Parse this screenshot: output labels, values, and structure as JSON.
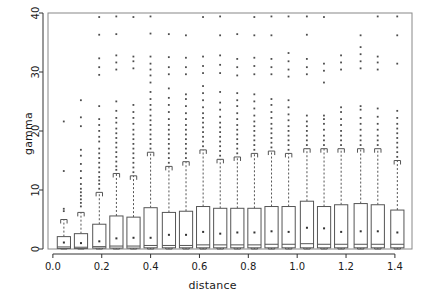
{
  "chart_data": {
    "type": "box",
    "title": "",
    "xlabel": "distance",
    "ylabel": "gamma",
    "xlim": [
      -0.02,
      1.47
    ],
    "ylim": [
      0,
      40
    ],
    "xticks": [
      0.0,
      0.2,
      0.4,
      0.6,
      0.8,
      1.0,
      1.2,
      1.4
    ],
    "xticklabels": [
      "0.0",
      "0.2",
      "0.4",
      "0.6",
      "0.8",
      "1.0",
      "1.2",
      "1.4"
    ],
    "yticks": [
      0,
      10,
      20,
      30,
      40
    ],
    "yticklabels": [
      "0",
      "10",
      "20",
      "30",
      "40"
    ],
    "grid": false,
    "legend": null,
    "box_line_color": "#555555",
    "whisker_style": "dashed",
    "mean_marker": "dot",
    "outlier_marker": "dot",
    "n_boxes": 19,
    "boxes": [
      {
        "x": 0.045,
        "q1": 0.1,
        "median": 0.35,
        "q3": 2.1,
        "whisker_low": 0.0,
        "whisker_high": 5.0,
        "mean": 1.1,
        "outliers": [
          6.4,
          6.8,
          13.2,
          21.6
        ]
      },
      {
        "x": 0.115,
        "q1": 0.1,
        "median": 0.3,
        "q3": 2.6,
        "whisker_low": 0.0,
        "whisker_high": 6.2,
        "mean": 1.0,
        "outliers": [
          7.2,
          7.8,
          8.4,
          9.0,
          9.6,
          10.2,
          11.0,
          12.0,
          13.2,
          14.4,
          15.8,
          16.8,
          20.8,
          22.3,
          25.2
        ]
      },
      {
        "x": 0.19,
        "q1": 0.15,
        "median": 0.4,
        "q3": 4.2,
        "whisker_low": 0.0,
        "whisker_high": 9.6,
        "mean": 1.3,
        "outliers": [
          10.2,
          11.0,
          11.6,
          12.2,
          13.0,
          13.8,
          14.6,
          15.4,
          16.2,
          17.0,
          18.2,
          19.0,
          20.0,
          21.0,
          22.0,
          24.2,
          29.5,
          30.8,
          32.3,
          36.3,
          39.3
        ]
      },
      {
        "x": 0.26,
        "q1": 0.15,
        "median": 0.5,
        "q3": 5.6,
        "whisker_low": 0.0,
        "whisker_high": 12.8,
        "mean": 1.8,
        "outliers": [
          13.4,
          14.0,
          14.8,
          15.6,
          16.4,
          17.2,
          18.0,
          18.8,
          19.6,
          20.4,
          21.4,
          22.2,
          23.4,
          25.0,
          30.4,
          31.6,
          32.8,
          36.4,
          39.4
        ]
      },
      {
        "x": 0.33,
        "q1": 0.15,
        "median": 0.5,
        "q3": 5.4,
        "whisker_low": 0.0,
        "whisker_high": 12.4,
        "mean": 1.9,
        "outliers": [
          13.0,
          13.8,
          14.6,
          15.4,
          16.2,
          17.0,
          17.8,
          18.6,
          19.4,
          20.2,
          21.2,
          22.2,
          23.2,
          24.4,
          30.6,
          31.8,
          32.6,
          39.3
        ]
      },
      {
        "x": 0.4,
        "q1": 0.2,
        "median": 0.6,
        "q3": 7.0,
        "whisker_low": 0.0,
        "whisker_high": 16.4,
        "mean": 1.9,
        "outliers": [
          17.0,
          17.8,
          18.6,
          19.4,
          20.2,
          21.0,
          21.8,
          22.6,
          23.6,
          24.4,
          25.4,
          26.6,
          28.2,
          29.4,
          30.4,
          31.4,
          32.6,
          36.5,
          39.4
        ]
      },
      {
        "x": 0.475,
        "q1": 0.2,
        "median": 0.6,
        "q3": 6.2,
        "whisker_low": 0.0,
        "whisker_high": 14.0,
        "mean": 2.4,
        "outliers": [
          14.6,
          15.4,
          16.2,
          17.0,
          17.8,
          18.6,
          19.4,
          20.2,
          21.0,
          22.0,
          23.2,
          24.4,
          25.6,
          27.2,
          29.6,
          30.8,
          32.5,
          36.4
        ]
      },
      {
        "x": 0.545,
        "q1": 0.2,
        "median": 0.6,
        "q3": 6.4,
        "whisker_low": 0.0,
        "whisker_high": 14.8,
        "mean": 2.4,
        "outliers": [
          15.4,
          16.2,
          17.0,
          17.8,
          18.6,
          19.4,
          20.2,
          21.0,
          22.0,
          23.0,
          24.2,
          25.4,
          26.2,
          29.6,
          30.8,
          32.4,
          36.2
        ]
      },
      {
        "x": 0.615,
        "q1": 0.2,
        "median": 0.7,
        "q3": 7.2,
        "whisker_low": 0.0,
        "whisker_high": 16.8,
        "mean": 2.9,
        "outliers": [
          17.4,
          18.2,
          19.0,
          19.8,
          20.6,
          21.4,
          22.2,
          23.0,
          24.0,
          25.2,
          26.4,
          27.6,
          29.8,
          31.0,
          32.6,
          39.3
        ]
      },
      {
        "x": 0.685,
        "q1": 0.2,
        "median": 0.7,
        "q3": 6.9,
        "whisker_low": 0.0,
        "whisker_high": 15.2,
        "mean": 2.6,
        "outliers": [
          15.8,
          16.6,
          17.4,
          18.2,
          19.0,
          19.8,
          20.6,
          21.4,
          22.4,
          23.6,
          24.8,
          26.6,
          29.8,
          31.2,
          32.8,
          36.2,
          39.4
        ]
      },
      {
        "x": 0.755,
        "q1": 0.2,
        "median": 0.7,
        "q3": 6.9,
        "whisker_low": 0.0,
        "whisker_high": 15.6,
        "mean": 2.8,
        "outliers": [
          16.2,
          17.0,
          17.8,
          18.6,
          19.4,
          20.2,
          21.0,
          22.0,
          23.0,
          24.2,
          25.2,
          26.4,
          29.4,
          30.8,
          32.2,
          36.4
        ]
      },
      {
        "x": 0.825,
        "q1": 0.2,
        "median": 0.7,
        "q3": 6.9,
        "whisker_low": 0.0,
        "whisker_high": 16.2,
        "mean": 2.8,
        "outliers": [
          16.8,
          17.6,
          18.4,
          19.2,
          20.0,
          20.8,
          21.6,
          22.6,
          23.8,
          25.0,
          26.2,
          29.6,
          31.0,
          32.4,
          36.2,
          39.3
        ]
      },
      {
        "x": 0.895,
        "q1": 0.2,
        "median": 0.8,
        "q3": 7.2,
        "whisker_low": 0.0,
        "whisker_high": 16.6,
        "mean": 3.0,
        "outliers": [
          17.2,
          18.0,
          18.8,
          19.6,
          20.4,
          21.2,
          22.2,
          23.2,
          24.4,
          25.4,
          29.6,
          30.8,
          32.2,
          36.2,
          39.4
        ]
      },
      {
        "x": 0.965,
        "q1": 0.2,
        "median": 0.8,
        "q3": 7.2,
        "whisker_low": 0.0,
        "whisker_high": 16.2,
        "mean": 2.9,
        "outliers": [
          16.8,
          17.6,
          18.4,
          19.2,
          20.0,
          20.8,
          21.8,
          22.8,
          24.0,
          25.2,
          29.2,
          30.4,
          31.8,
          33.2,
          39.4
        ]
      },
      {
        "x": 1.04,
        "q1": 0.2,
        "median": 0.9,
        "q3": 8.1,
        "whisker_low": 0.0,
        "whisker_high": 17.0,
        "mean": 3.6,
        "outliers": [
          17.6,
          18.4,
          19.2,
          20.0,
          20.8,
          21.6,
          22.6,
          29.6,
          30.8,
          32.2,
          36.3,
          39.4
        ]
      },
      {
        "x": 1.11,
        "q1": 0.2,
        "median": 0.8,
        "q3": 7.2,
        "whisker_low": 0.0,
        "whisker_high": 17.0,
        "mean": 3.5,
        "outliers": [
          17.6,
          18.4,
          19.2,
          20.2,
          21.2,
          22.0,
          22.6,
          28.2,
          30.2,
          31.4,
          39.3
        ]
      },
      {
        "x": 1.18,
        "q1": 0.2,
        "median": 0.8,
        "q3": 7.5,
        "whisker_low": 0.0,
        "whisker_high": 17.0,
        "mean": 2.9,
        "outliers": [
          17.6,
          18.4,
          19.2,
          20.0,
          21.0,
          22.0,
          23.2,
          24.0,
          30.4,
          31.6,
          32.8
        ]
      },
      {
        "x": 1.26,
        "q1": 0.2,
        "median": 0.8,
        "q3": 7.7,
        "whisker_low": 0.0,
        "whisker_high": 17.0,
        "mean": 3.0,
        "outliers": [
          17.6,
          18.4,
          19.2,
          20.2,
          21.2,
          22.2,
          23.6,
          24.2,
          30.6,
          31.8,
          33.0,
          34.2,
          36.2
        ]
      },
      {
        "x": 1.33,
        "q1": 0.2,
        "median": 0.8,
        "q3": 7.5,
        "whisker_low": 0.0,
        "whisker_high": 17.0,
        "mean": 3.0,
        "outliers": [
          17.6,
          18.4,
          19.2,
          20.2,
          21.2,
          22.4,
          23.8,
          30.4,
          31.6,
          32.6,
          39.4
        ]
      },
      {
        "x": 1.41,
        "q1": 0.2,
        "median": 0.8,
        "q3": 6.6,
        "whisker_low": 0.0,
        "whisker_high": 15.0,
        "mean": 2.8,
        "outliers": [
          15.6,
          16.4,
          17.2,
          18.0,
          18.8,
          19.6,
          20.4,
          21.2,
          22.2,
          23.4,
          31.4,
          36.2,
          39.4
        ]
      }
    ]
  }
}
